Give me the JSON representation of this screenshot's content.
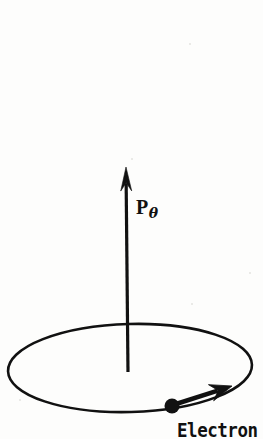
{
  "figure": {
    "background_color": "#fdfdfc",
    "ink_color": "#111111",
    "width": 263,
    "height": 439,
    "labels": {
      "momentum_symbol": "P",
      "momentum_subscript": "θ",
      "momentum_full": "Pθ",
      "electron": "Electron"
    },
    "elements": {
      "orbit_ellipse": {
        "name": "orbit-ellipse",
        "center_x": 130,
        "center_y": 368,
        "radius_x": 122,
        "radius_y": 44,
        "stroke_width": 2.6,
        "rotation_deg": -1.5
      },
      "momentum_vector": {
        "name": "momentum-vector",
        "tail_x": 128,
        "tail_y": 372,
        "tip_x": 126,
        "tip_y": 167,
        "shaft_width": 3.2,
        "head_length": 24,
        "head_width": 11
      },
      "electron_dot": {
        "name": "electron-dot",
        "center_x": 172,
        "center_y": 406,
        "radius": 7.5
      },
      "velocity_vector": {
        "name": "velocity-vector",
        "tail_x": 176,
        "tail_y": 404,
        "tip_x": 232,
        "tip_y": 386,
        "shaft_width": 4.5,
        "head_length": 22,
        "head_width": 17
      }
    }
  }
}
